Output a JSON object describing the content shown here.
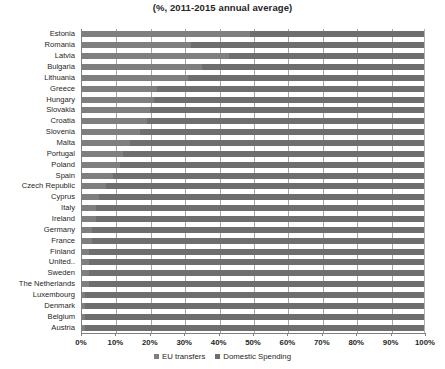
{
  "chart_data": {
    "type": "bar",
    "title": "(%, 2011-2015 annual average)",
    "subtitle": "",
    "xlabel": "",
    "ylabel": "",
    "orientation": "horizontal",
    "stacked": true,
    "normalized_100pct": true,
    "xlim": [
      0,
      100
    ],
    "grid": true,
    "legend_position": "bottom",
    "tick_labels": [
      "0%",
      "10%",
      "20%",
      "30%",
      "40%",
      "50%",
      "60%",
      "70%",
      "80%",
      "90%",
      "100%"
    ],
    "tick_values": [
      0,
      10,
      20,
      30,
      40,
      50,
      60,
      70,
      80,
      90,
      100
    ],
    "categories": [
      "Estonia",
      "Romania",
      "Latvia",
      "Bulgaria",
      "Lithuania",
      "Greece",
      "Hungary",
      "Slovakia",
      "Croatia",
      "Slovenia",
      "Malta",
      "Portugal",
      "Poland",
      "Spain",
      "Czech Republic",
      "Cyprus",
      "Italy",
      "Ireland",
      "Germany",
      "France",
      "Finland",
      "United..",
      "Sweden",
      "The Netherlands",
      "Luxembourg",
      "Denmark",
      "Belgium",
      "Austria"
    ],
    "series": [
      {
        "name": "EU transfers",
        "color": "#7f7f7f",
        "values": [
          49,
          32,
          43,
          35,
          31,
          22,
          21,
          20,
          19,
          17,
          14,
          12,
          11,
          9,
          7,
          5,
          4,
          4,
          3,
          3,
          2,
          2,
          2,
          2,
          1,
          1,
          1,
          1
        ]
      },
      {
        "name": "Domestic Spending",
        "color": "#6e6e6e",
        "values": [
          51,
          68,
          57,
          65,
          69,
          78,
          79,
          80,
          81,
          83,
          86,
          88,
          89,
          91,
          93,
          95,
          96,
          96,
          97,
          97,
          98,
          98,
          98,
          98,
          99,
          99,
          99,
          99
        ]
      }
    ],
    "legend": [
      {
        "label": "EU transfers",
        "swatch": "#7f7f7f"
      },
      {
        "label": "Domestic Spending",
        "swatch": "#6e6e6e"
      }
    ]
  }
}
